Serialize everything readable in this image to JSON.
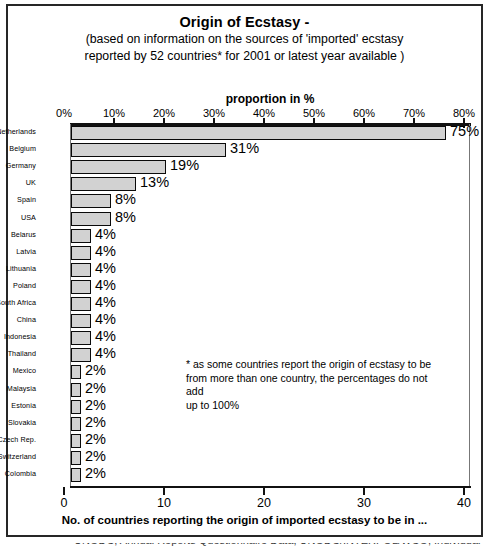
{
  "chart_data": {
    "type": "bar",
    "orientation": "horizontal",
    "title": "Origin of Ecstasy -",
    "subtitle_line1": "(based on information on the sources of 'imported' ecstasy",
    "subtitle_line2": "reported by 52 countries* for 2001 or latest year available )",
    "top_axis_label": "proportion in %",
    "xlabel": "No. of countries reporting the origin of imported ecstasy to be in ...",
    "ylabel": "",
    "grid": false,
    "legend": null,
    "top_axis": {
      "ticks": [
        0,
        10,
        20,
        30,
        40,
        50,
        60,
        70,
        80
      ],
      "ticklabels": [
        "0%",
        "10%",
        "20%",
        "30%",
        "40%",
        "50%",
        "60%",
        "70%",
        "80%"
      ],
      "range": [
        0,
        80
      ]
    },
    "bottom_axis": {
      "ticks": [
        0,
        10,
        20,
        30,
        40
      ],
      "ticklabels": [
        "0",
        "10",
        "20",
        "30",
        "40"
      ],
      "range": [
        0,
        40
      ]
    },
    "categories": [
      "Netherlands",
      "Belgium",
      "Germany",
      "UK",
      "Spain",
      "USA",
      "Belarus",
      "Latvia",
      "Lithuania",
      "Poland",
      "South Africa",
      "China",
      "Indonesia",
      "Thailand",
      "Mexico",
      "Malaysia",
      "Estonia",
      "Slovakia",
      "Czech Rep.",
      "Switzerland",
      "Colombia"
    ],
    "values": [
      75,
      31,
      19,
      13,
      8,
      8,
      4,
      4,
      4,
      4,
      4,
      4,
      4,
      4,
      2,
      2,
      2,
      2,
      2,
      2,
      2
    ],
    "value_labels": [
      "75%",
      "31%",
      "19%",
      "13%",
      "8%",
      "8%",
      "4%",
      "4%",
      "4%",
      "4%",
      "4%",
      "4%",
      "4%",
      "4%",
      "2%",
      "2%",
      "2%",
      "2%",
      "2%",
      "2%",
      "2%"
    ],
    "counts": [
      37.5,
      15.5,
      9.5,
      6.5,
      4,
      4,
      2,
      2,
      2,
      2,
      2,
      2,
      2,
      2,
      1,
      1,
      1,
      1,
      1,
      1,
      1
    ],
    "annotations": [
      "* as some countries report the origin of ecstasy to be",
      "from more than one country, the percentages do not add",
      "up to 100%"
    ],
    "colors": {
      "bar_fill": "#d2d2d2",
      "bar_edge": "#0a0a0a",
      "axis": "#111111",
      "border": "#262626",
      "text": "#000000"
    }
  },
  "footnote": {
    "line1": "* as some countries report the origin of ecstasy to be",
    "line2": "from more than one country, the percentages do not add",
    "line3": "up to 100%"
  },
  "source_clipped": "UNODC, Annual Reports Questionnaire Data; UNODC/INTERPOL/WCO, Individual"
}
